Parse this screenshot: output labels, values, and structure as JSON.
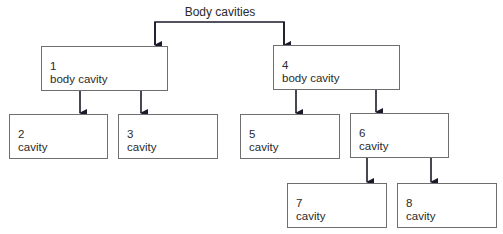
{
  "diagram": {
    "title": "Body cavities",
    "nodes": [
      {
        "id": "1",
        "number": "1",
        "label": "body cavity",
        "parent": "root"
      },
      {
        "id": "2",
        "number": "2",
        "label": "cavity",
        "parent": "1"
      },
      {
        "id": "3",
        "number": "3",
        "label": "cavity",
        "parent": "1"
      },
      {
        "id": "4",
        "number": "4",
        "label": "body cavity",
        "parent": "root"
      },
      {
        "id": "5",
        "number": "5",
        "label": "cavity",
        "parent": "4"
      },
      {
        "id": "6",
        "number": "6",
        "label": "cavity",
        "parent": "4"
      },
      {
        "id": "7",
        "number": "7",
        "label": "cavity",
        "parent": "6"
      },
      {
        "id": "8",
        "number": "8",
        "label": "cavity",
        "parent": "6"
      }
    ],
    "colors": {
      "line": "#1a1a2a",
      "box_border": "#6f6f6f",
      "text": "#2a2a2a"
    }
  }
}
